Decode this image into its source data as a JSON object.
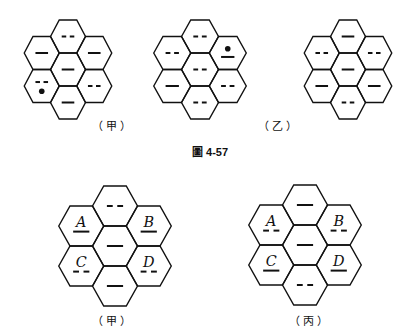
{
  "caption": "圖 4-57",
  "stroke_color": "#111111",
  "top_row": {
    "figures": [
      {
        "id": "top-1",
        "cx": 68,
        "top": 20,
        "w": 35,
        "h": 33,
        "cells": {
          "top": {
            "mark": "dash"
          },
          "upper_left": {
            "mark": "solid"
          },
          "upper_right": {
            "mark": "solid"
          },
          "center": {
            "mark": "solid"
          },
          "lower_left": {
            "mark": "dash",
            "dot": "below"
          },
          "lower_right": {
            "mark": "dash"
          },
          "bottom": {
            "mark": "solid"
          }
        }
      },
      {
        "id": "top-2",
        "cx": 200,
        "top": 20,
        "w": 37,
        "h": 33,
        "cells": {
          "top": {
            "mark": "dash"
          },
          "upper_left": {
            "mark": "dash"
          },
          "upper_right": {
            "mark": "solid",
            "dot": "above"
          },
          "center": {
            "mark": "dash"
          },
          "lower_left": {
            "mark": "solid"
          },
          "lower_right": {
            "mark": "dash"
          },
          "bottom": {
            "mark": "dash"
          }
        }
      },
      {
        "id": "top-3",
        "cx": 348,
        "top": 20,
        "w": 35,
        "h": 33,
        "cells": {
          "top": {
            "mark": "solid"
          },
          "upper_left": {
            "mark": "dash"
          },
          "upper_right": {
            "mark": "dash"
          },
          "center": {
            "mark": "solid"
          },
          "lower_left": {
            "mark": "solid"
          },
          "lower_right": {
            "mark": "solid"
          },
          "bottom": {
            "mark": "dash"
          }
        }
      }
    ],
    "labels": [
      {
        "text": "（甲）",
        "x": 113,
        "y": 121
      },
      {
        "text": "（乙）",
        "x": 279,
        "y": 121
      }
    ]
  },
  "bottom_row": {
    "figures": [
      {
        "id": "bottom-1",
        "cx": 115,
        "top": 186,
        "w": 45,
        "h": 40,
        "cells": {
          "top": {
            "mark": "dash"
          },
          "upper_left": {
            "mark": "solid",
            "letter": "A"
          },
          "upper_right": {
            "mark": "solid",
            "letter": "B"
          },
          "center": {
            "mark": "solid"
          },
          "lower_left": {
            "mark": "dash",
            "letter": "C"
          },
          "lower_right": {
            "mark": "dash",
            "letter": "D"
          },
          "bottom": {
            "mark": "solid"
          }
        }
      },
      {
        "id": "bottom-2",
        "cx": 305,
        "top": 185,
        "w": 45,
        "h": 40,
        "cells": {
          "top": {
            "mark": "solid"
          },
          "upper_left": {
            "mark": "dash",
            "letter": "A"
          },
          "upper_right": {
            "mark": "dash",
            "letter": "B"
          },
          "center": {
            "mark": "solid"
          },
          "lower_left": {
            "mark": "solid",
            "letter": "C"
          },
          "lower_right": {
            "mark": "solid",
            "letter": "D"
          },
          "bottom": {
            "mark": "dash"
          }
        }
      }
    ],
    "labels": [
      {
        "text": "（甲）",
        "x": 113,
        "y": 316
      },
      {
        "text": "（丙）",
        "x": 310,
        "y": 316
      }
    ]
  }
}
